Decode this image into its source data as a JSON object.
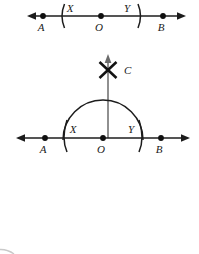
{
  "figure": {
    "background_color": "#ffffff",
    "ink_color": "#1c1c1c",
    "vertical_line_color": "#6b6b6b"
  },
  "top_panel": {
    "name": "line-with-arc-marks",
    "line": {
      "y": 16,
      "x_start": 27,
      "x_end": 186,
      "left_arrow": true,
      "right_arrow": true
    },
    "points": [
      {
        "id": "A",
        "label": "A",
        "x": 43,
        "y": 16,
        "label_x": 41,
        "label_y": 31
      },
      {
        "id": "O",
        "label": "O",
        "x": 101,
        "y": 16,
        "label_x": 99,
        "label_y": 31
      },
      {
        "id": "B",
        "label": "B",
        "x": 163,
        "y": 16,
        "label_x": 161,
        "label_y": 31
      }
    ],
    "arc_marks": [
      {
        "id": "arc-left",
        "x": 62,
        "label": "X",
        "label_x": 67,
        "label_y": 12
      },
      {
        "id": "arc-right",
        "x": 140,
        "label": "Y",
        "label_x": 127,
        "label_y": 12
      }
    ]
  },
  "bottom_panel": {
    "name": "semicircle-perpendicular-construction",
    "line": {
      "y": 138,
      "x_start": 16,
      "x_end": 190,
      "left_arrow": true,
      "right_arrow": true
    },
    "points": [
      {
        "id": "A",
        "label": "A",
        "x": 45,
        "y": 138,
        "label_x": 42,
        "label_y": 153
      },
      {
        "id": "O",
        "label": "O",
        "x": 103,
        "y": 138,
        "label_x": 100,
        "label_y": 153
      },
      {
        "id": "B",
        "label": "B",
        "x": 161,
        "y": 138,
        "label_x": 158,
        "label_y": 153
      }
    ],
    "arc_marks": [
      {
        "id": "arc-left",
        "x": 65,
        "label": "X",
        "label_x": 70,
        "label_y": 133
      },
      {
        "id": "arc-right",
        "x": 141,
        "label": "Y",
        "label_x": 130,
        "label_y": 133
      }
    ],
    "semicircle": {
      "center_x": 103,
      "center_y": 138,
      "radius": 40,
      "top_y": 98
    },
    "vertical_line": {
      "x": 108,
      "y_bottom": 138,
      "y_top": 56,
      "arrow_up": true
    },
    "point_c": {
      "id": "C",
      "label": "C",
      "mark": "x-cross",
      "x": 108,
      "y": 70,
      "size": 9,
      "label_x": 122,
      "label_y": 74
    }
  },
  "artifact": {
    "name": "corner-smudge",
    "present": true,
    "x": 0,
    "y": 243
  }
}
